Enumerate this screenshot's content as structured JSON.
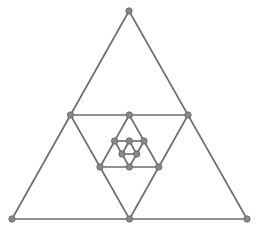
{
  "diagram": {
    "type": "fractal-nested-triangles",
    "colors": {
      "background": "#ffffff",
      "stroke": "#6b6b6b",
      "point_fill": "#888888",
      "point_stroke": "#666666"
    },
    "stroke_width": 1.6,
    "point_radius": 3.2,
    "outer_triangle": {
      "top": [
        129,
        11
      ],
      "bottom_left": [
        12,
        219
      ],
      "bottom_right": [
        247,
        219
      ]
    },
    "levels": 4
  }
}
